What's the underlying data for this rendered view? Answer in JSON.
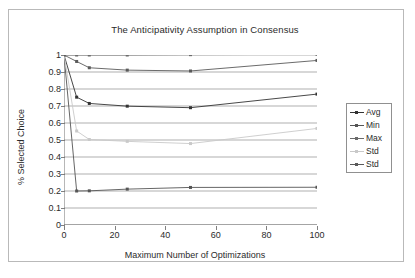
{
  "page": {
    "background": "#ffffff",
    "border_color": "#b9b9b9"
  },
  "chart_data": {
    "type": "line",
    "title": "The Anticipativity Assumption in Consensus",
    "xlabel": "Maximum Number of Optimizations",
    "ylabel": "% Selected Choice",
    "x": [
      0,
      5,
      10,
      25,
      50,
      100
    ],
    "xlim": [
      0,
      100
    ],
    "ylim": [
      0,
      1
    ],
    "xticks": [
      0,
      20,
      40,
      60,
      80,
      100
    ],
    "xticklabels": [
      "0",
      "20",
      "40",
      "60",
      "80",
      "100"
    ],
    "yticks": [
      0,
      0.1,
      0.2,
      0.3,
      0.4,
      0.5,
      0.6,
      0.7,
      0.8,
      0.9,
      1
    ],
    "yticklabels": [
      "0",
      "0.1",
      "0.2",
      "0.3",
      "0.4",
      "0.5",
      "0.6",
      "0.7",
      "0.8",
      "0.9",
      "1"
    ],
    "grid": "horizontal",
    "legend_position": "right",
    "series": [
      {
        "name": "Avg",
        "color": "#333333",
        "values": [
          1.0,
          0.752,
          0.715,
          0.699,
          0.69,
          0.77
        ]
      },
      {
        "name": "Min",
        "color": "#555555",
        "values": [
          1.0,
          0.2,
          0.201,
          0.211,
          0.221,
          0.222
        ]
      },
      {
        "name": "Max",
        "color": "#6b6b6b",
        "values": [
          1.0,
          1.0,
          1.0,
          1.0,
          1.002,
          1.004
        ]
      },
      {
        "name": "Std",
        "color": "#c9c9c9",
        "values": [
          1.0,
          0.553,
          0.503,
          0.492,
          0.479,
          0.568
        ]
      },
      {
        "name": "Std",
        "color": "#5a5a5a",
        "values": [
          1.0,
          0.962,
          0.925,
          0.911,
          0.906,
          0.968
        ]
      }
    ]
  },
  "legend": {
    "entries": [
      {
        "label": "Avg"
      },
      {
        "label": "Min"
      },
      {
        "label": "Max"
      },
      {
        "label": "Std"
      },
      {
        "label": "Std"
      }
    ]
  }
}
